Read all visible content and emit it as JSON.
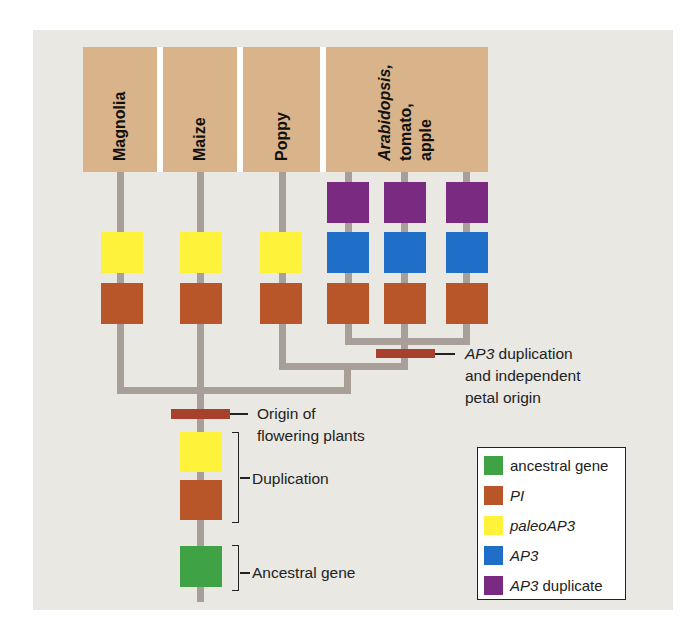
{
  "taxa": [
    {
      "label": "Magnolia",
      "italic": false
    },
    {
      "label": "Maize",
      "italic": false
    },
    {
      "label": "Poppy",
      "italic": false
    },
    {
      "label_lines": [
        "Arabidopsis,",
        "tomato,",
        "apple"
      ],
      "italic_first_line": true
    }
  ],
  "gene_columns": [
    {
      "taxon": "Magnolia",
      "genes": [
        "paleoAP3",
        "PI"
      ]
    },
    {
      "taxon": "Maize",
      "genes": [
        "paleoAP3",
        "PI"
      ]
    },
    {
      "taxon": "Poppy",
      "genes": [
        "paleoAP3",
        "PI"
      ]
    },
    {
      "taxon": "Arabidopsis",
      "genes": [
        "AP3 duplicate",
        "AP3",
        "PI"
      ]
    },
    {
      "taxon": "tomato",
      "genes": [
        "AP3 duplicate",
        "AP3",
        "PI"
      ]
    },
    {
      "taxon": "apple",
      "genes": [
        "AP3 duplicate",
        "AP3",
        "PI"
      ]
    }
  ],
  "annotations": {
    "ap3_dup": {
      "italic_part": "AP3",
      "line1_rest": " duplication",
      "line2": "and independent",
      "line3": "petal origin"
    },
    "origin": {
      "line1": "Origin of",
      "line2": "flowering plants"
    },
    "duplication": "Duplication",
    "ancestral": "Ancestral gene"
  },
  "legend": {
    "items": [
      {
        "label": "ancestral gene",
        "italic_part": "",
        "color": "#3fa346"
      },
      {
        "label": "PI",
        "italic_part": "PI",
        "color": "#b8562a"
      },
      {
        "label": "paleoAP3",
        "italic_part": "paleoAP3",
        "color": "#fff23a"
      },
      {
        "label": "AP3",
        "italic_part": "AP3",
        "color": "#1f6fc8"
      },
      {
        "label": "AP3 duplicate",
        "italic_part": "AP3",
        "rest": " duplicate",
        "color": "#7a2a80"
      }
    ]
  },
  "colors": {
    "header": "#d9b48a",
    "branch": "#a89f99",
    "event_bar": "#a8402e",
    "background": "#e9e8e2"
  }
}
